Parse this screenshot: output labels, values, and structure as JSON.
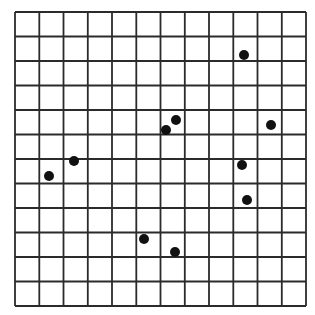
{
  "figure": {
    "type": "dot-grid",
    "width": 315,
    "height": 315,
    "background": "#ffffff",
    "grid": {
      "columns": 12,
      "rows": 12,
      "left": 15,
      "top": 12,
      "right": 306,
      "bottom": 306,
      "line_color": "#2b2b2b",
      "line_width": 1.8
    },
    "dot_color": "#111111",
    "dot_radius": 5,
    "dots": [
      {
        "x": 244,
        "y": 55
      },
      {
        "x": 176,
        "y": 120
      },
      {
        "x": 166,
        "y": 130
      },
      {
        "x": 271,
        "y": 125
      },
      {
        "x": 74,
        "y": 161
      },
      {
        "x": 49,
        "y": 176
      },
      {
        "x": 242,
        "y": 165
      },
      {
        "x": 247,
        "y": 200
      },
      {
        "x": 144,
        "y": 239
      },
      {
        "x": 175,
        "y": 252
      }
    ]
  }
}
